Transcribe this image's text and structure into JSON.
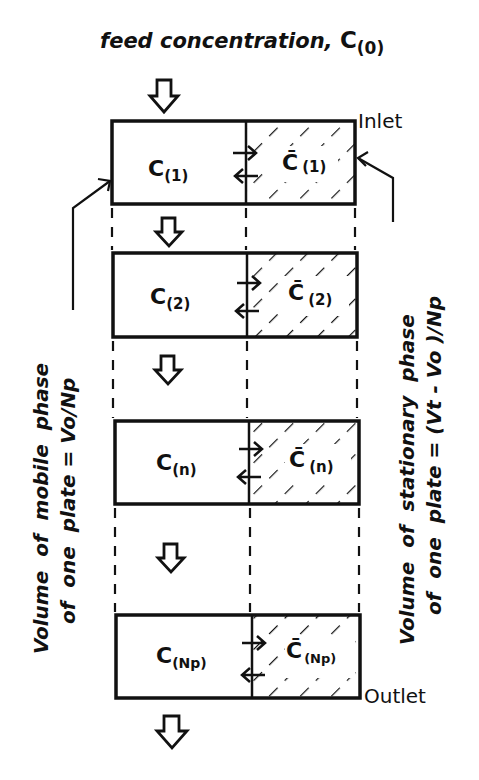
{
  "title": {
    "text": "feed concentration,",
    "symbol": "C",
    "subscript": "(0)"
  },
  "labels": {
    "inlet": "Inlet",
    "outlet": "Outlet"
  },
  "left_annotation": {
    "line1": "Volume  of  mobile  phase",
    "line2": "of  one  plate = Vo/Np"
  },
  "right_annotation": {
    "line1": "Volume  of  stationary  phase",
    "line2": "of  one  plate = (Vt - Vo )/Np"
  },
  "plates": [
    {
      "mobile_symbol": "C",
      "mobile_sub": "(1)",
      "stationary_symbol": "C̄",
      "stationary_sub": "(1)"
    },
    {
      "mobile_symbol": "C",
      "mobile_sub": "(2)",
      "stationary_symbol": "C̄",
      "stationary_sub": "(2)"
    },
    {
      "mobile_symbol": "C",
      "mobile_sub": "(n)",
      "stationary_symbol": "C̄",
      "stationary_sub": "(n)"
    },
    {
      "mobile_symbol": "C",
      "mobile_sub": "(Np)",
      "stationary_symbol": "C̄",
      "stationary_sub": "(Np)"
    }
  ],
  "colors": {
    "ink": "#111111",
    "background": "#ffffff"
  }
}
